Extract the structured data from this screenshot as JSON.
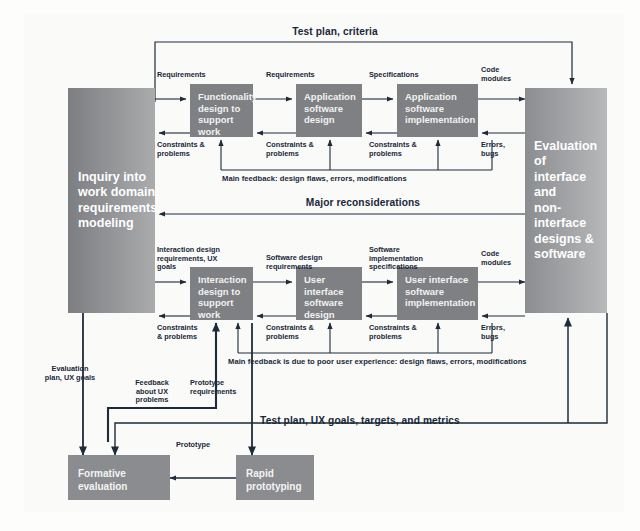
{
  "diagram": {
    "title_hidden": "The Wheel lifecycle: dual software and UX development processes",
    "colors": {
      "box_fill": "#7e8083",
      "big_left_fill": "#7c7e81",
      "big_right_fill": "#8b8d90",
      "bottom_fill": "#8a8c8f",
      "line": "#1d2b3a",
      "text_on_box": "#f2f2f2",
      "label_text": "#18283a",
      "page_bg": "#fafaf8"
    },
    "stages": {
      "left_column": {
        "label": "Inquiry into\nwork domain,\nrequirements,\nmodeling"
      },
      "right_column": {
        "label": "Evaluation of\ninterface and\nnon-interface\ndesigns &\nsoftware"
      },
      "software_row": [
        {
          "label": "Functionality\ndesign to\nsupport work"
        },
        {
          "label": "Application\nsoftware\ndesign"
        },
        {
          "label": "Application\nsoftware\nimplementation"
        }
      ],
      "ux_row": [
        {
          "label": "Interaction\ndesign to\nsupport work"
        },
        {
          "label": "User interface\nsoftware\ndesign"
        },
        {
          "label": "User interface\nsoftware\nimplementation"
        }
      ],
      "bottom_row": [
        {
          "label": "Formative\nevaluation"
        },
        {
          "label": "Rapid\nprototyping"
        }
      ]
    },
    "flow_labels": {
      "top_test_plan": "Test plan, criteria",
      "sw_requirements_1": "Requirements",
      "sw_requirements_2": "Requirements",
      "sw_specifications": "Specifications",
      "sw_code_modules": "Code\nmodules",
      "sw_constraints_1": "Constraints &\nproblems",
      "sw_constraints_2": "Constraints &\nproblems",
      "sw_constraints_3": "Constraints &\nproblems",
      "sw_errors_bugs": "Errors,\nbugs",
      "sw_main_feedback": "Main feedback: design flaws, errors, modifications",
      "major_reconsiderations": "Major reconsiderations",
      "ux_requirements": "Interaction design\nrequirements, UX\ngoals",
      "ux_software_design_req": "Software design\nrequirements",
      "ux_software_impl_spec": "Software\nimplementation\nspecifications",
      "ux_code_modules": "Code\nmodules",
      "ux_constraints_1": "Constraints\n& problems",
      "ux_constraints_2": "Constraints &\nproblems",
      "ux_constraints_3": "Constraints &\nproblems",
      "ux_errors_bugs": "Errors,\nbugs",
      "ux_main_feedback": "Main feedback is due to poor user experience: design flaws, errors, modifications",
      "evaluation_plan": "Evaluation\nplan, UX goals",
      "feedback_about_ux": "Feedback\nabout UX\nproblems",
      "prototype_requirements": "Prototype\nrequirements",
      "bottom_test_plan": "Test plan, UX goals, targets, and metrics",
      "prototype": "Prototype"
    }
  }
}
